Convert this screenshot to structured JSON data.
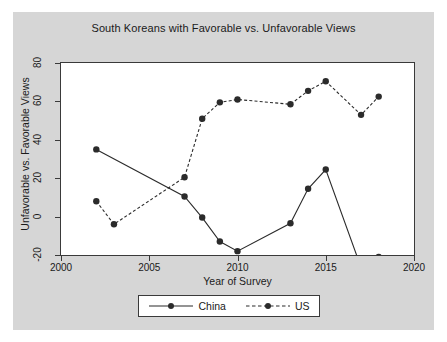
{
  "chart_data": {
    "type": "line",
    "title": "South Koreans with Favorable vs. Unfavorable Views",
    "xlabel": "Year of Survey",
    "ylabel": "Unfavorable vs. Favorable Views",
    "xlim": [
      2000,
      2020
    ],
    "ylim": [
      -20,
      80
    ],
    "xticks": [
      2000,
      2005,
      2010,
      2015,
      2020
    ],
    "yticks": [
      -20,
      0,
      20,
      40,
      60,
      80
    ],
    "grid": false,
    "legend_position": "below-center",
    "series": [
      {
        "name": "China",
        "style": "solid",
        "marker": "circle",
        "color": "#2b2b2b",
        "points": [
          {
            "x": 2002,
            "y": 35
          },
          {
            "x": 2007,
            "y": 10.5
          },
          {
            "x": 2008,
            "y": -0.5
          },
          {
            "x": 2009,
            "y": -13
          },
          {
            "x": 2010,
            "y": -18
          },
          {
            "x": 2013,
            "y": -3.5
          },
          {
            "x": 2014,
            "y": 14.5
          },
          {
            "x": 2015,
            "y": 24.5
          },
          {
            "x": 2017,
            "y": -26.5
          },
          {
            "x": 2018,
            "y": -21
          }
        ]
      },
      {
        "name": "US",
        "style": "dashed",
        "marker": "circle",
        "color": "#2b2b2b",
        "points": [
          {
            "x": 2002,
            "y": 8
          },
          {
            "x": 2003,
            "y": -4
          },
          {
            "x": 2007,
            "y": 20.5
          },
          {
            "x": 2008,
            "y": 51
          },
          {
            "x": 2009,
            "y": 59.5
          },
          {
            "x": 2010,
            "y": 61
          },
          {
            "x": 2013,
            "y": 58.5
          },
          {
            "x": 2014,
            "y": 65.5
          },
          {
            "x": 2015,
            "y": 70.5
          },
          {
            "x": 2017,
            "y": 53
          },
          {
            "x": 2018,
            "y": 62.5
          }
        ]
      }
    ]
  },
  "legend": {
    "items": [
      {
        "label": "China"
      },
      {
        "label": "US"
      }
    ]
  },
  "colors": {
    "panel_background": "#d6d6d6",
    "plot_background": "#ffffff",
    "axis": "#3a3a3a",
    "text": "#1a1a1a",
    "series": "#2b2b2b"
  }
}
